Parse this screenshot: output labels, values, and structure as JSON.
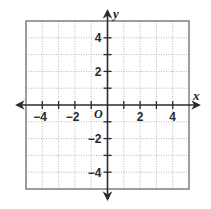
{
  "diagram": {
    "type": "coordinate-plane",
    "axes": {
      "x_label": "x",
      "y_label": "y",
      "origin_label": "O",
      "x_range": [
        -5,
        5
      ],
      "y_range": [
        -5,
        5
      ]
    },
    "x_tick_labels": [
      {
        "value": -4,
        "text": "−4"
      },
      {
        "value": -2,
        "text": "−2"
      },
      {
        "value": 2,
        "text": "2"
      },
      {
        "value": 4,
        "text": "4"
      }
    ],
    "y_tick_labels": [
      {
        "value": 4,
        "text": "4"
      },
      {
        "value": 2,
        "text": "2"
      },
      {
        "value": -2,
        "text": "−2"
      },
      {
        "value": -4,
        "text": "−4"
      }
    ],
    "grid": {
      "style": "dotted",
      "spacing": 1
    },
    "colors": {
      "axis": "#2b2b2b",
      "grid": "#b8b8b8",
      "border": "#6a6a6a"
    }
  }
}
